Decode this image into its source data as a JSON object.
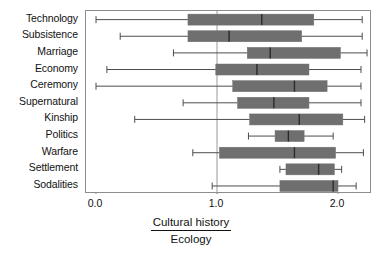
{
  "chart_data": {
    "type": "boxplot",
    "orientation": "horizontal",
    "title": "",
    "xlabel_numerator": "Cultural history",
    "xlabel_denominator": "Ecology",
    "ylabel": "",
    "xlim": [
      -0.08,
      2.29
    ],
    "xticks": [
      0.0,
      1.0,
      2.0
    ],
    "xticklabels": [
      "0.0",
      "1.0",
      "2.0"
    ],
    "grid": false,
    "reference_line": 1.0,
    "legend": "none",
    "box_color": "#6f6f6f",
    "line_color": "#4d4d4d",
    "frame_color": "#8d8d8d",
    "categories": [
      "Technology",
      "Subsistence",
      "Marriage",
      "Economy",
      "Ceremony",
      "Supernatural",
      "Kinship",
      "Politics",
      "Warfare",
      "Settlement",
      "Sodalities"
    ],
    "boxes": [
      {
        "category": "Technology",
        "whisker_low": 0.0,
        "q1": 0.76,
        "median": 1.37,
        "q3": 1.8,
        "whisker_high": 2.2
      },
      {
        "category": "Subsistence",
        "whisker_low": 0.2,
        "q1": 0.76,
        "median": 1.1,
        "q3": 1.7,
        "whisker_high": 2.2
      },
      {
        "category": "Marriage",
        "whisker_low": 0.64,
        "q1": 1.25,
        "median": 1.44,
        "q3": 2.02,
        "whisker_high": 2.24
      },
      {
        "category": "Economy",
        "whisker_low": 0.09,
        "q1": 0.99,
        "median": 1.33,
        "q3": 1.76,
        "whisker_high": 2.19
      },
      {
        "category": "Ceremony",
        "whisker_low": 0.0,
        "q1": 1.13,
        "median": 1.64,
        "q3": 1.91,
        "whisker_high": 2.19
      },
      {
        "category": "Supernatural",
        "whisker_low": 0.72,
        "q1": 1.17,
        "median": 1.47,
        "q3": 1.76,
        "whisker_high": 2.19
      },
      {
        "category": "Kinship",
        "whisker_low": 0.32,
        "q1": 1.27,
        "median": 1.68,
        "q3": 2.04,
        "whisker_high": 2.22
      },
      {
        "category": "Politics",
        "whisker_low": 1.26,
        "q1": 1.48,
        "median": 1.59,
        "q3": 1.72,
        "whisker_high": 1.96
      },
      {
        "category": "Warfare",
        "whisker_low": 0.8,
        "q1": 1.02,
        "median": 1.64,
        "q3": 1.98,
        "whisker_high": 2.21
      },
      {
        "category": "Settlement",
        "whisker_low": 1.52,
        "q1": 1.57,
        "median": 1.84,
        "q3": 1.97,
        "whisker_high": 2.03
      },
      {
        "category": "Sodalities",
        "whisker_low": 0.96,
        "q1": 1.52,
        "median": 1.96,
        "q3": 2.0,
        "whisker_high": 2.15
      }
    ]
  }
}
